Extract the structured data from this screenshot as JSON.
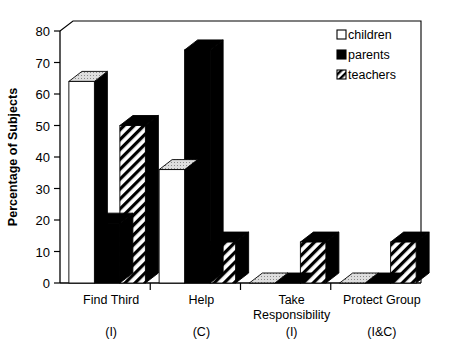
{
  "chart_data": {
    "type": "bar",
    "title": "",
    "subtitle": "",
    "xlabel": "",
    "ylabel": "Percentage of Subjects",
    "ylim": [
      0,
      80
    ],
    "yticks": [
      0,
      10,
      20,
      30,
      40,
      50,
      60,
      70,
      80
    ],
    "ytick_labels": [
      "0",
      "10",
      "20",
      "30",
      "40",
      "50",
      "60",
      "70",
      "80"
    ],
    "grid": false,
    "legend_position": "top-right",
    "style": "3d-bar",
    "categories": [
      "Find Third",
      "Help",
      "Take Responsibility",
      "Protect Group"
    ],
    "category_sublabels": [
      "(I)",
      "(C)",
      "(I)",
      "(I&C)"
    ],
    "series": [
      {
        "name": "children",
        "fill": "solid-white",
        "color": "#ffffff",
        "values": [
          64,
          36,
          0,
          0
        ]
      },
      {
        "name": "parents",
        "fill": "solid-black",
        "color": "#000000",
        "values": [
          19,
          74,
          0,
          0
        ]
      },
      {
        "name": "teachers",
        "fill": "diagonal-hatch",
        "color": "#ffffff",
        "values": [
          50,
          13,
          13,
          13
        ]
      }
    ]
  },
  "axis": {
    "y_title": "Percentage of Subjects",
    "ticks": [
      "80",
      "70",
      "60",
      "50",
      "40",
      "30",
      "20",
      "10",
      "0"
    ]
  },
  "categories": [
    {
      "label": "Find Third",
      "sub": "(I)"
    },
    {
      "label": "Help",
      "sub": "(C)"
    },
    {
      "label": "Take",
      "label2": "Responsibility",
      "sub": "(I)"
    },
    {
      "label": "Protect Group",
      "sub": "(I&C)"
    }
  ],
  "legend": {
    "items": [
      {
        "label": "children",
        "marker": "empty-square-marker"
      },
      {
        "label": "parents",
        "marker": "filled-square-marker"
      },
      {
        "label": "teachers",
        "marker": "hatched-square-marker"
      }
    ]
  },
  "colors": {
    "axis": "#000000",
    "bar_side": "#000000",
    "bar_top": "#d8d8d8",
    "background": "#ffffff"
  }
}
